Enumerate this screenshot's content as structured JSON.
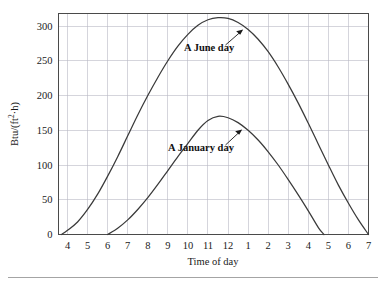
{
  "chart_data": {
    "type": "line",
    "title": "",
    "xlabel": "Time of day",
    "ylabel": "Btu/(ft²·h)",
    "x_tick_labels": [
      "4",
      "5",
      "6",
      "7",
      "8",
      "9",
      "10",
      "11",
      "12",
      "1",
      "2",
      "3",
      "4",
      "5",
      "6",
      "7"
    ],
    "x_tick_values": [
      4,
      5,
      6,
      7,
      8,
      9,
      10,
      11,
      12,
      13,
      14,
      15,
      16,
      17,
      18,
      19
    ],
    "xlim": [
      3.55,
      19.0
    ],
    "y_tick_labels": [
      "0",
      "50",
      "100",
      "150",
      "200",
      "250",
      "300"
    ],
    "y_tick_values": [
      0,
      50,
      100,
      150,
      200,
      250,
      300
    ],
    "ylim": [
      0,
      318
    ],
    "grid": true,
    "legend": "inline-annotations",
    "series": [
      {
        "name": "A June day",
        "label": "A June day",
        "peak_value": 312,
        "peak_time": "11:30",
        "start_time": "3:42",
        "end_time": "7:00",
        "x": [
          3.7,
          4.0,
          4.5,
          5.0,
          5.5,
          6.0,
          6.5,
          7.0,
          7.5,
          8.0,
          8.5,
          9.0,
          9.5,
          10.0,
          10.5,
          11.0,
          11.5,
          12.0,
          12.5,
          13.0,
          13.5,
          14.0,
          14.5,
          15.0,
          15.5,
          16.0,
          16.5,
          17.0,
          17.5,
          18.0,
          18.5,
          19.0
        ],
        "values": [
          0,
          6,
          18,
          36,
          58,
          84,
          112,
          142,
          172,
          200,
          226,
          250,
          271,
          288,
          301,
          309,
          312,
          311,
          305,
          295,
          281,
          263,
          241,
          216,
          189,
          160,
          130,
          100,
          71,
          45,
          21,
          0
        ]
      },
      {
        "name": "A January day",
        "label": "A January day",
        "peak_value": 170,
        "peak_time": "11:30",
        "start_time": "6:00",
        "end_time": "4:45",
        "x": [
          6.0,
          6.5,
          7.0,
          7.5,
          8.0,
          8.5,
          9.0,
          9.5,
          10.0,
          10.5,
          11.0,
          11.5,
          12.0,
          12.5,
          13.0,
          13.5,
          14.0,
          14.5,
          15.0,
          15.5,
          16.0,
          16.5,
          16.78
        ],
        "values": [
          0,
          9,
          21,
          36,
          53,
          72,
          92,
          112,
          131,
          150,
          164,
          170,
          168,
          161,
          150,
          136,
          119,
          100,
          79,
          57,
          34,
          10,
          0
        ]
      }
    ],
    "annotations": [
      {
        "text": "A June day",
        "points_to_series": "A June day",
        "arrow": "up-right"
      },
      {
        "text": "A January day",
        "points_to_series": "A January day",
        "arrow": "up-right"
      }
    ]
  },
  "axes": {
    "x_title": "Time of day",
    "y_title": "Btu/(ft²·h)",
    "y_title_parts": {
      "base": "Btu/(ft",
      "sup": "2",
      "tail": "·h)"
    }
  },
  "colors": {
    "grid": "#b9b9c4",
    "frame": "#4a4a4a",
    "curve": "#3a3a3a",
    "text": "#1a1a1a",
    "background": "#ffffff",
    "footer_rule": "#9a9a9a"
  }
}
